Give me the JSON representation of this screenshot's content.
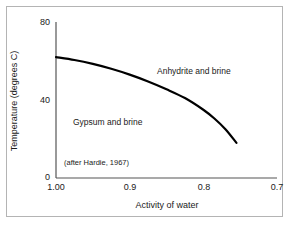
{
  "chart_data": {
    "type": "line",
    "title": "",
    "subtitle": "",
    "xlabel": "Activity of water",
    "ylabel": "Temperature (degrees C)",
    "xlim": [
      1.0,
      0.7
    ],
    "ylim": [
      0,
      80
    ],
    "x_tick_labels": [
      "1.00",
      "0.9",
      "0.8",
      "0.7"
    ],
    "x_tick_values": [
      1.0,
      0.9,
      0.8,
      0.7
    ],
    "y_tick_labels": [
      "80",
      "40",
      "0"
    ],
    "y_tick_values": [
      80,
      40,
      0
    ],
    "grid": false,
    "legend": "none",
    "x_axis_direction": "decreasing",
    "series": [
      {
        "name": "Gypsum-anhydrite equilibrium boundary",
        "x": [
          1.0,
          0.975,
          0.95,
          0.925,
          0.9,
          0.875,
          0.85,
          0.825,
          0.8,
          0.785,
          0.77,
          0.755
        ],
        "y": [
          62.0,
          60.5,
          58.5,
          56.0,
          53.0,
          49.5,
          45.5,
          41.0,
          35.0,
          30.5,
          25.0,
          18.0
        ]
      }
    ],
    "annotations": [
      {
        "name": "anhydrite-region-label",
        "text": "Anhydrite and brine",
        "x": 0.886,
        "y": 54.0
      },
      {
        "name": "gypsum-region-label",
        "text": "Gypsum and brine",
        "x": 0.948,
        "y": 32.5
      },
      {
        "name": "source-note",
        "text": "(after Hardie, 1967)",
        "x": 0.989,
        "y": 9.0
      }
    ]
  },
  "axis": {
    "y_title": "Temperature (degrees C)",
    "x_title": "Activity of water",
    "y_ticks": [
      {
        "label": "80"
      },
      {
        "label": "40"
      },
      {
        "label": "0"
      }
    ],
    "x_ticks": [
      {
        "label": "1.00"
      },
      {
        "label": "0.9"
      },
      {
        "label": "0.8"
      },
      {
        "label": "0.7"
      }
    ]
  },
  "regions": [
    {
      "label": "Anhydrite and brine"
    },
    {
      "label": "Gypsum and brine"
    }
  ],
  "note": {
    "text": "(after Hardie, 1967)"
  },
  "colors": {
    "background": "#ffffff",
    "frame": "#b4b4b4",
    "axis": "#4d4d4d",
    "curve": "#000000",
    "text": "#1a1a1a"
  }
}
